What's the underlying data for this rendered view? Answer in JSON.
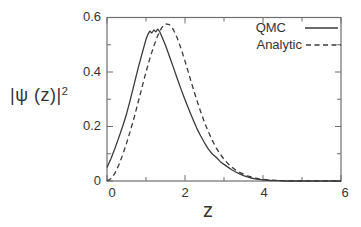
{
  "chart_data": {
    "type": "line",
    "title": "",
    "xlabel": "z",
    "ylabel_base": "|ψ (z)|",
    "ylabel_exp": "2",
    "xlim": [
      0,
      6
    ],
    "ylim": [
      0,
      0.6
    ],
    "grid": false,
    "legend_position": "top-right",
    "x_ticks": {
      "major": [
        0,
        2,
        4,
        6
      ],
      "minor": [
        1,
        3,
        5
      ],
      "labels": [
        "0",
        "2",
        "4",
        "6"
      ]
    },
    "y_ticks": {
      "major": [
        0,
        0.2,
        0.4,
        0.6
      ],
      "minor": [
        0.1,
        0.3,
        0.5
      ],
      "labels": [
        "0",
        "0.2",
        "0.4",
        "0.6"
      ]
    },
    "colors": {
      "ink": "#3a3a3a",
      "frame": "#6e6e6e",
      "background": "#ffffff"
    },
    "series": [
      {
        "name": "QMC",
        "style": "solid",
        "points": [
          [
            0,
            0.05
          ],
          [
            0.1,
            0.082
          ],
          [
            0.2,
            0.118
          ],
          [
            0.3,
            0.158
          ],
          [
            0.4,
            0.2
          ],
          [
            0.5,
            0.245
          ],
          [
            0.6,
            0.3
          ],
          [
            0.7,
            0.357
          ],
          [
            0.8,
            0.415
          ],
          [
            0.9,
            0.468
          ],
          [
            1.0,
            0.52
          ],
          [
            1.05,
            0.538
          ],
          [
            1.1,
            0.55
          ],
          [
            1.15,
            0.543
          ],
          [
            1.2,
            0.554
          ],
          [
            1.25,
            0.547
          ],
          [
            1.3,
            0.557
          ],
          [
            1.35,
            0.548
          ],
          [
            1.4,
            0.532
          ],
          [
            1.5,
            0.498
          ],
          [
            1.6,
            0.458
          ],
          [
            1.7,
            0.418
          ],
          [
            1.8,
            0.376
          ],
          [
            1.9,
            0.336
          ],
          [
            2.0,
            0.298
          ],
          [
            2.1,
            0.262
          ],
          [
            2.2,
            0.227
          ],
          [
            2.3,
            0.194
          ],
          [
            2.4,
            0.166
          ],
          [
            2.5,
            0.14
          ],
          [
            2.6,
            0.117
          ],
          [
            2.7,
            0.099
          ],
          [
            2.8,
            0.087
          ],
          [
            2.9,
            0.072
          ],
          [
            3.0,
            0.061
          ],
          [
            3.1,
            0.051
          ],
          [
            3.2,
            0.041
          ],
          [
            3.3,
            0.033
          ],
          [
            3.4,
            0.026
          ],
          [
            3.5,
            0.02
          ],
          [
            3.6,
            0.015
          ],
          [
            3.7,
            0.011
          ],
          [
            3.8,
            0.008
          ],
          [
            3.9,
            0.006
          ],
          [
            4.0,
            0.004
          ],
          [
            4.2,
            0.002
          ],
          [
            4.4,
            0.001
          ],
          [
            4.6,
            0
          ],
          [
            5.0,
            0
          ],
          [
            5.5,
            0
          ],
          [
            6.0,
            0
          ]
        ]
      },
      {
        "name": "Analytic",
        "style": "dashed",
        "points": [
          [
            0,
            0
          ],
          [
            0.1,
            0.008
          ],
          [
            0.2,
            0.028
          ],
          [
            0.3,
            0.058
          ],
          [
            0.4,
            0.095
          ],
          [
            0.5,
            0.138
          ],
          [
            0.6,
            0.185
          ],
          [
            0.7,
            0.235
          ],
          [
            0.8,
            0.29
          ],
          [
            0.9,
            0.345
          ],
          [
            1.0,
            0.4
          ],
          [
            1.1,
            0.45
          ],
          [
            1.2,
            0.495
          ],
          [
            1.3,
            0.533
          ],
          [
            1.4,
            0.562
          ],
          [
            1.5,
            0.577
          ],
          [
            1.6,
            0.574
          ],
          [
            1.7,
            0.556
          ],
          [
            1.8,
            0.525
          ],
          [
            1.9,
            0.485
          ],
          [
            2.0,
            0.44
          ],
          [
            2.1,
            0.392
          ],
          [
            2.2,
            0.344
          ],
          [
            2.3,
            0.298
          ],
          [
            2.4,
            0.255
          ],
          [
            2.5,
            0.215
          ],
          [
            2.6,
            0.18
          ],
          [
            2.7,
            0.149
          ],
          [
            2.8,
            0.122
          ],
          [
            2.9,
            0.099
          ],
          [
            3.0,
            0.08
          ],
          [
            3.1,
            0.064
          ],
          [
            3.2,
            0.051
          ],
          [
            3.3,
            0.04
          ],
          [
            3.4,
            0.032
          ],
          [
            3.5,
            0.025
          ],
          [
            3.6,
            0.019
          ],
          [
            3.7,
            0.015
          ],
          [
            3.8,
            0.011
          ],
          [
            3.9,
            0.008
          ],
          [
            4.0,
            0.006
          ],
          [
            4.2,
            0.003
          ],
          [
            4.4,
            0.002
          ],
          [
            4.6,
            0.001
          ],
          [
            5.0,
            0
          ],
          [
            5.5,
            0
          ],
          [
            6.0,
            0
          ]
        ]
      }
    ]
  }
}
